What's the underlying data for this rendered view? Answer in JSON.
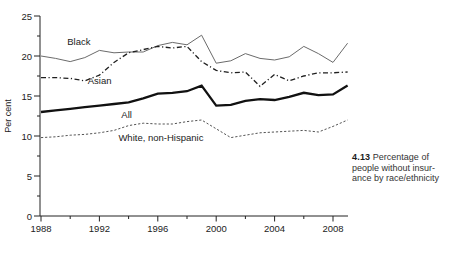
{
  "figure": {
    "caption_number": "4.13",
    "caption_line1": "Percentage of",
    "caption_line2": "people without insur-",
    "caption_line3": "ance by race/ethnicity"
  },
  "colors": {
    "axis": "#222222",
    "tick_text": "#222222",
    "caption_text": "#333333",
    "series_black": "#6b6b6b",
    "series_asian": "#1f1f1f",
    "series_all": "#111111",
    "series_white": "#4a4a4a"
  },
  "chart_data": {
    "type": "line",
    "title": "",
    "xlabel": "",
    "ylabel": "Per cent",
    "ylim": [
      0,
      25
    ],
    "xlim": [
      1988,
      2009
    ],
    "grid": false,
    "legend": "inline-labels",
    "y_major_ticks": [
      0,
      5,
      10,
      15,
      20,
      25
    ],
    "y_minor_ticks": [
      2.5,
      7.5,
      12.5,
      17.5,
      22.5
    ],
    "x_major_ticks": [
      1988,
      1992,
      1996,
      2000,
      2004,
      2008
    ],
    "x_minor_ticks": [
      1990,
      1994,
      1998,
      2002,
      2006
    ],
    "x": [
      1988,
      1989,
      1990,
      1991,
      1992,
      1993,
      1994,
      1995,
      1996,
      1997,
      1998,
      1999,
      2000,
      2001,
      2002,
      2003,
      2004,
      2005,
      2006,
      2007,
      2008,
      2009
    ],
    "series": [
      {
        "name": "Black",
        "line_style": "solid-thin",
        "color": "#6b6b6b",
        "label": {
          "x": 1989.8,
          "y": 21.4
        },
        "values": [
          20.0,
          19.7,
          19.3,
          19.8,
          20.7,
          20.4,
          20.5,
          20.5,
          21.3,
          21.7,
          21.4,
          22.6,
          19.1,
          19.4,
          20.3,
          19.7,
          19.5,
          19.9,
          21.2,
          20.3,
          19.2,
          21.6
        ]
      },
      {
        "name": "Asian",
        "line_style": "dash-dot",
        "color": "#1f1f1f",
        "label": {
          "x": 1991.2,
          "y": 16.5
        },
        "values": [
          17.3,
          17.3,
          17.2,
          16.9,
          17.6,
          19.2,
          20.4,
          20.8,
          21.2,
          21.0,
          21.2,
          19.3,
          18.2,
          17.9,
          18.0,
          16.2,
          17.7,
          16.9,
          17.5,
          17.9,
          17.9,
          18.0
        ]
      },
      {
        "name": "All",
        "line_style": "solid-thick",
        "color": "#111111",
        "label": {
          "x": 1993.5,
          "y": 12.25
        },
        "values": [
          13.0,
          13.2,
          13.4,
          13.6,
          13.8,
          14.0,
          14.2,
          14.7,
          15.3,
          15.4,
          15.6,
          16.3,
          13.8,
          13.9,
          14.4,
          14.6,
          14.5,
          14.9,
          15.4,
          15.1,
          15.2,
          16.3
        ]
      },
      {
        "name": "White, non-Hispanic",
        "line_style": "dashed",
        "color": "#4a4a4a",
        "label": {
          "x": 1993.3,
          "y": 9.35
        },
        "values": [
          9.8,
          9.9,
          10.1,
          10.2,
          10.4,
          10.7,
          11.3,
          11.6,
          11.5,
          11.5,
          11.8,
          12.0,
          10.9,
          9.8,
          10.1,
          10.4,
          10.5,
          10.6,
          10.7,
          10.5,
          11.2,
          12.0
        ]
      }
    ]
  }
}
